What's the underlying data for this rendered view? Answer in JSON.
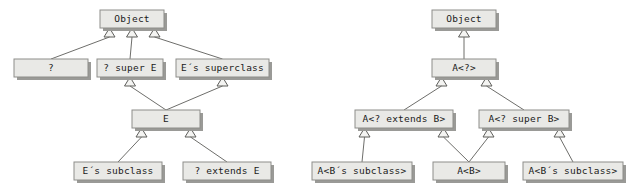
{
  "figure": {
    "background_color": "#ffffff",
    "box_fill": "#e9e9e6",
    "box_border": "#8d8d8a",
    "box_shadow": "#9a9a97",
    "line_color": "#6e6e6b",
    "arrow_fill": "#f4f4f2",
    "text_color": "#1a1a1a"
  },
  "diagrams": [
    {
      "id": "left-diagram",
      "name": "type-variable-wildcard-hierarchy",
      "nodes": [
        {
          "id": "l-object",
          "label": "Object",
          "x": 100,
          "y": 10,
          "w": 64,
          "h": 18
        },
        {
          "id": "l-question",
          "label": "?",
          "x": 14,
          "y": 59,
          "w": 74,
          "h": 18
        },
        {
          "id": "l-super-e",
          "label": "? super E",
          "x": 97,
          "y": 59,
          "w": 66,
          "h": 18
        },
        {
          "id": "l-e-superclass",
          "label": "E´s superclass",
          "x": 176,
          "y": 59,
          "w": 93,
          "h": 18
        },
        {
          "id": "l-e",
          "label": "E",
          "x": 132,
          "y": 110,
          "w": 68,
          "h": 18
        },
        {
          "id": "l-e-subclass",
          "label": "E´s subclass",
          "x": 74,
          "y": 162,
          "w": 88,
          "h": 18
        },
        {
          "id": "l-extends-e",
          "label": "? extends E",
          "x": 183,
          "y": 162,
          "w": 88,
          "h": 18
        }
      ],
      "edges": [
        {
          "from": "l-question",
          "to": "l-object",
          "arrow_at": "l-object"
        },
        {
          "from": "l-super-e",
          "to": "l-object",
          "arrow_at": "l-object"
        },
        {
          "from": "l-e-superclass",
          "to": "l-object",
          "arrow_at": "l-object"
        },
        {
          "from": "l-e",
          "to": "l-super-e",
          "arrow_at": "l-super-e"
        },
        {
          "from": "l-e",
          "to": "l-e-superclass",
          "arrow_at": "l-e-superclass"
        },
        {
          "from": "l-e-subclass",
          "to": "l-e",
          "arrow_at": "l-e"
        },
        {
          "from": "l-extends-e",
          "to": "l-e",
          "arrow_at": "l-e"
        }
      ]
    },
    {
      "id": "right-diagram",
      "name": "generic-type-wildcard-hierarchy",
      "nodes": [
        {
          "id": "r-object",
          "label": "Object",
          "x": 432,
          "y": 10,
          "w": 64,
          "h": 18
        },
        {
          "id": "r-a-wild",
          "label": "A<?>",
          "x": 432,
          "y": 59,
          "w": 64,
          "h": 18
        },
        {
          "id": "r-a-extends-b",
          "label": "A<? extends B>",
          "x": 355,
          "y": 110,
          "w": 98,
          "h": 18
        },
        {
          "id": "r-a-super-b",
          "label": "A<? super B>",
          "x": 479,
          "y": 110,
          "w": 90,
          "h": 18
        },
        {
          "id": "r-a-b-sub-left",
          "label": "A<B´s subclass>",
          "x": 312,
          "y": 162,
          "w": 100,
          "h": 18
        },
        {
          "id": "r-a-b",
          "label": "A<B>",
          "x": 433,
          "y": 162,
          "w": 72,
          "h": 18
        },
        {
          "id": "r-a-b-sub-right",
          "label": "A<B´s subclass>",
          "x": 523,
          "y": 162,
          "w": 100,
          "h": 18
        }
      ],
      "edges": [
        {
          "from": "r-a-wild",
          "to": "r-object",
          "arrow_at": "r-object"
        },
        {
          "from": "r-a-extends-b",
          "to": "r-a-wild",
          "arrow_at": "r-a-wild"
        },
        {
          "from": "r-a-super-b",
          "to": "r-a-wild",
          "arrow_at": "r-a-wild"
        },
        {
          "from": "r-a-b-sub-left",
          "to": "r-a-extends-b",
          "arrow_at": "r-a-extends-b"
        },
        {
          "from": "r-a-b",
          "to": "r-a-extends-b",
          "arrow_at": "r-a-extends-b"
        },
        {
          "from": "r-a-b",
          "to": "r-a-super-b",
          "arrow_at": "r-a-super-b"
        },
        {
          "from": "r-a-b-sub-right",
          "to": "r-a-super-b",
          "arrow_at": "r-a-super-b"
        }
      ]
    }
  ]
}
